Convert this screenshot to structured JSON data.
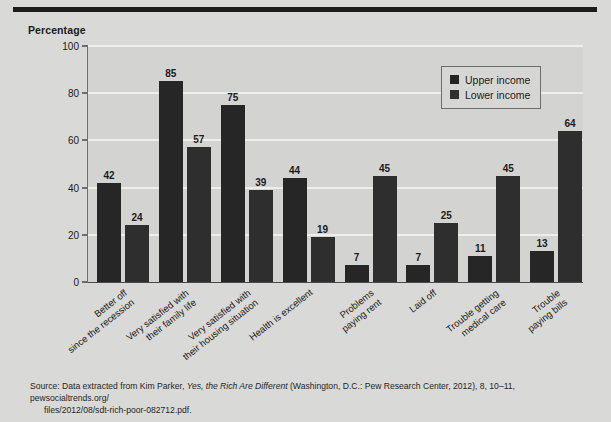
{
  "chart_data": {
    "type": "bar",
    "title": "",
    "ylabel": "Percentage",
    "xlabel": "",
    "ylim": [
      0,
      100
    ],
    "yticks": [
      0,
      20,
      40,
      60,
      80,
      100
    ],
    "grid": true,
    "legend_position": "top-right",
    "categories": [
      "Better off since the recession",
      "Very satisfied with their family life",
      "Very satisfied with their housing situation",
      "Health is excellent",
      "Problems paying rent",
      "Laid off",
      "Trouble getting medical care",
      "Trouble paying bills"
    ],
    "category_lines": [
      [
        "Better off",
        "since the recession"
      ],
      [
        "Very satisfied with",
        "their family life"
      ],
      [
        "Very satisfied with",
        "their housing situation"
      ],
      [
        "Health is excellent"
      ],
      [
        "Problems",
        "paying rent"
      ],
      [
        "Laid off"
      ],
      [
        "Trouble getting",
        "medical care"
      ],
      [
        "Trouble",
        "paying bills"
      ]
    ],
    "series": [
      {
        "name": "Upper income",
        "color": "#262626",
        "values": [
          42,
          85,
          75,
          44,
          7,
          7,
          11,
          13
        ]
      },
      {
        "name": "Lower income",
        "color": "#2e2e2e",
        "values": [
          24,
          57,
          39,
          19,
          45,
          25,
          45,
          64
        ]
      }
    ]
  },
  "axis": {
    "y_title": "Percentage",
    "tick_labels": [
      "100",
      "80",
      "60",
      "40",
      "20",
      "0"
    ]
  },
  "legend": {
    "items": [
      {
        "label": "Upper income",
        "swatch": "upper"
      },
      {
        "label": "Lower income",
        "swatch": "lower"
      }
    ]
  },
  "source": {
    "prefix": "Source: Data extracted from Kim Parker, ",
    "title_italic": "Yes, the Rich Are Different",
    "suffix": " (Washington, D.C.: Pew Research Center, 2012), 8, 10–11, pewsocialtrends.org/",
    "second_line": "files/2012/08/sdt-rich-poor-082712.pdf."
  },
  "colors": {
    "page_background": "#d9d9d7",
    "plot_background": "#d3d3d1",
    "gridline": "#eeeeec",
    "axis": "#6d6d6d",
    "rule": "#1c1c1c",
    "text": "#1b1b1b"
  }
}
